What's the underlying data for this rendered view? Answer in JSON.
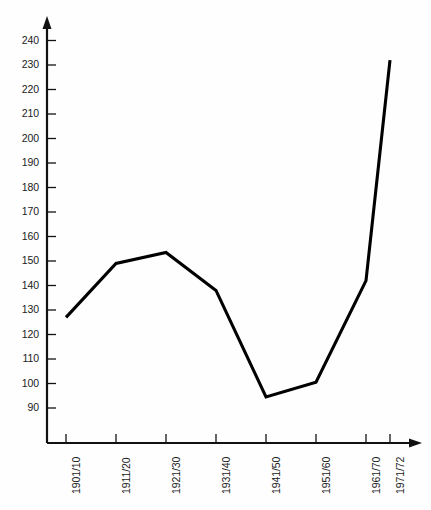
{
  "chart_data": {
    "type": "line",
    "title": "",
    "subtitle": "",
    "xlabel": "",
    "ylabel": "",
    "categories": [
      "1901/10",
      "1911/20",
      "1921/30",
      "1931/40",
      "1941/50",
      "1951/60",
      "1961/70",
      "1971/72"
    ],
    "values": [
      127,
      149,
      153.5,
      138,
      94.5,
      100.5,
      142,
      232
    ],
    "series": [
      {
        "name": "",
        "values": [
          127,
          149,
          153.5,
          138,
          94.5,
          100.5,
          142,
          232
        ]
      }
    ],
    "ylim": [
      85,
      245
    ],
    "ytick_labels": [
      "90",
      "100",
      "110",
      "120",
      "130",
      "140",
      "150",
      "160",
      "170",
      "180",
      "190",
      "200",
      "210",
      "220",
      "230",
      "240"
    ],
    "ytick_values": [
      90,
      100,
      110,
      120,
      130,
      140,
      150,
      160,
      170,
      180,
      190,
      200,
      210,
      220,
      230,
      240
    ],
    "xtick_labels": [
      "1901/10",
      "1911/20",
      "1921/30",
      "1931/40",
      "1941/50",
      "1951/60",
      "1961/70",
      "1971/72"
    ],
    "grid": false,
    "legend": false,
    "legend_position": "none",
    "line_color": "#000000",
    "axis_color": "#111111",
    "background_color": "#fefefe",
    "annotations": []
  }
}
